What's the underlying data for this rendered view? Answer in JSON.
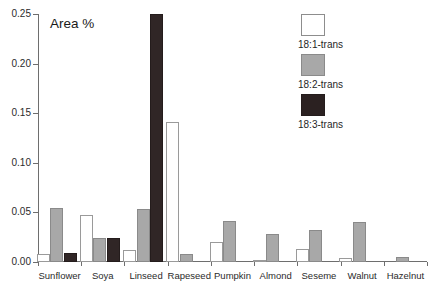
{
  "chart_data": {
    "type": "bar",
    "title": "Area %",
    "xlabel": "",
    "ylabel": "Area %",
    "ylim": [
      0,
      0.25
    ],
    "yticks": [
      0.0,
      0.05,
      0.1,
      0.15,
      0.2,
      0.25
    ],
    "ytick_labels": [
      "0.00",
      "0.05",
      "0.10",
      "0.15",
      "0.20",
      "0.25"
    ],
    "grid": false,
    "legend_position": "top-right",
    "categories": [
      "Sunflower",
      "Soya",
      "Linseed",
      "Rapeseed",
      "Pumpkin",
      "Almond",
      "Seseme",
      "Walnut",
      "Hazelnut"
    ],
    "series": [
      {
        "name": "18:1-trans",
        "color": "#ffffff",
        "values": [
          0.008,
          0.047,
          0.012,
          0.141,
          0.02,
          0.002,
          0.013,
          0.004,
          0.0
        ]
      },
      {
        "name": "18:2-trans",
        "color": "#a8a8a8",
        "values": [
          0.054,
          0.024,
          0.053,
          0.008,
          0.041,
          0.028,
          0.032,
          0.04,
          0.005
        ]
      },
      {
        "name": "18:3-trans",
        "color": "#2b2121",
        "values": [
          0.009,
          0.024,
          0.25,
          0.0,
          0.0,
          0.0,
          0.0,
          0.0,
          0.0
        ]
      }
    ]
  }
}
